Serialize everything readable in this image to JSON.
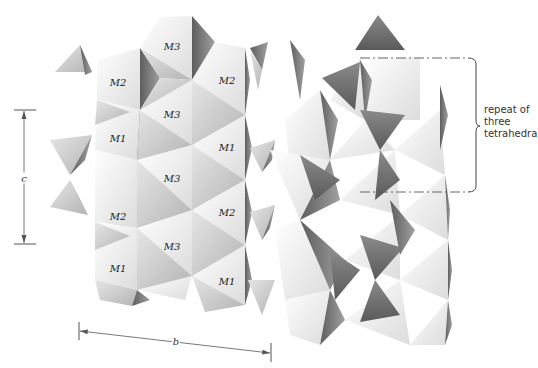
{
  "figure": {
    "site_labels": [
      {
        "text": "M3",
        "x": 172,
        "y": 46
      },
      {
        "text": "M2",
        "x": 118,
        "y": 82
      },
      {
        "text": "M2",
        "x": 227,
        "y": 80
      },
      {
        "text": "M3",
        "x": 172,
        "y": 114
      },
      {
        "text": "M1",
        "x": 118,
        "y": 138
      },
      {
        "text": "M1",
        "x": 227,
        "y": 147
      },
      {
        "text": "M3",
        "x": 172,
        "y": 178
      },
      {
        "text": "M2",
        "x": 118,
        "y": 216
      },
      {
        "text": "M2",
        "x": 227,
        "y": 212
      },
      {
        "text": "M3",
        "x": 172,
        "y": 246
      },
      {
        "text": "M1",
        "x": 118,
        "y": 268
      },
      {
        "text": "M1",
        "x": 227,
        "y": 281
      }
    ],
    "axes": {
      "c": {
        "label": "c",
        "x": 24,
        "y1": 110,
        "y2": 243,
        "label_y": 178
      },
      "b": {
        "label": "b",
        "x1": 80,
        "y1": 328,
        "x2": 270,
        "y2": 352,
        "label_x": 176,
        "label_y": 341
      }
    },
    "annotation": {
      "lines": [
        "repeat of",
        "three",
        "tetrahedra"
      ],
      "box": {
        "x1": 360,
        "y1": 58,
        "x2": 470,
        "y2": 192
      }
    },
    "colors": {
      "light_face": "#f2f2f2",
      "mid_face": "#c8c8c8",
      "dark_face": "#7a7a7a",
      "tetra_dark": "#6e6e6e",
      "line": "#555555"
    }
  }
}
